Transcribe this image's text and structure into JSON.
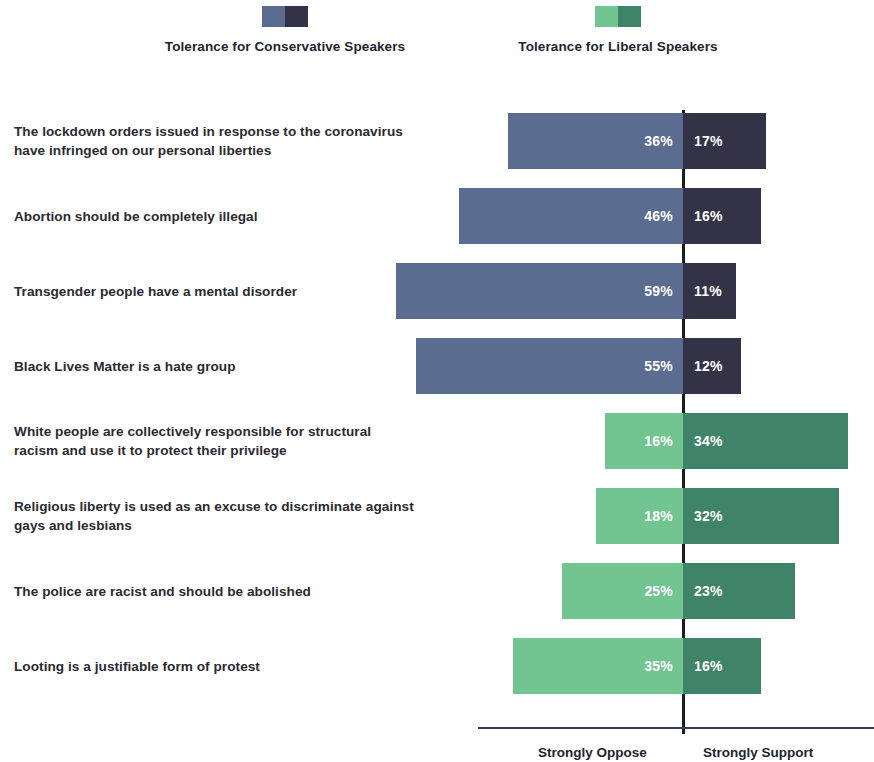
{
  "legend": {
    "items": [
      {
        "label": "Tolerance for Conservative Speakers",
        "color_left": "#5a6d90",
        "color_right": "#343247",
        "name": "conservative"
      },
      {
        "label": "Tolerance for Liberal Speakers",
        "color_left": "#72c491",
        "color_right": "#3f8468",
        "name": "liberal"
      }
    ]
  },
  "axis": {
    "left_label": "Strongly Oppose",
    "right_label": "Strongly Support"
  },
  "chart_data": {
    "type": "bar",
    "title": "",
    "subtype": "diverging-stacked",
    "xlabel": "",
    "ylabel": "",
    "grid": false,
    "legend_position": "top",
    "axis_left_label": "Strongly Oppose",
    "axis_right_label": "Strongly Support",
    "value_unit": "%",
    "center_at": 0,
    "series": [
      {
        "name": "Strongly Oppose",
        "side": "left"
      },
      {
        "name": "Strongly Support",
        "side": "right"
      }
    ],
    "groups": [
      {
        "group": "Tolerance for Conservative Speakers",
        "color_left": "#5a6d90",
        "color_right": "#343247",
        "categories": [
          "The lockdown orders issued in response to the coronavirus have infringed on our personal liberties",
          "Abortion should be completely illegal",
          "Transgender people have a mental disorder",
          "Black Lives Matter is a hate group"
        ],
        "oppose": [
          36,
          46,
          59,
          55
        ],
        "support": [
          17,
          16,
          11,
          12
        ]
      },
      {
        "group": "Tolerance for Liberal Speakers",
        "color_left": "#72c491",
        "color_right": "#3f8468",
        "categories": [
          "White people are collectively responsible for structural racism and use it to protect their privilege",
          "Religious liberty is used as an excuse to discriminate against gays and lesbians",
          "The police are racist and should be abolished",
          "Looting is a justifiable form of protest"
        ],
        "oppose": [
          16,
          18,
          25,
          35
        ],
        "support": [
          34,
          32,
          23,
          16
        ]
      }
    ]
  },
  "rows": [
    {
      "label_lines": [
        "The lockdown orders issued in response to the coronavirus",
        "have infringed on our personal liberties"
      ],
      "oppose": 36,
      "support": 17,
      "oppose_text": "36%",
      "support_text": "17%",
      "color_left": "#5a6d90",
      "color_right": "#343247"
    },
    {
      "label_lines": [
        "Abortion should be completely illegal"
      ],
      "oppose": 46,
      "support": 16,
      "oppose_text": "46%",
      "support_text": "16%",
      "color_left": "#5a6d90",
      "color_right": "#343247"
    },
    {
      "label_lines": [
        "Transgender people have a mental disorder"
      ],
      "oppose": 59,
      "support": 11,
      "oppose_text": "59%",
      "support_text": "11%",
      "color_left": "#5a6d90",
      "color_right": "#343247"
    },
    {
      "label_lines": [
        "Black Lives Matter is a hate group"
      ],
      "oppose": 55,
      "support": 12,
      "oppose_text": "55%",
      "support_text": "12%",
      "color_left": "#5a6d90",
      "color_right": "#343247"
    },
    {
      "label_lines": [
        "White people are collectively responsible for structural",
        "racism and use it to protect their privilege"
      ],
      "oppose": 16,
      "support": 34,
      "oppose_text": "16%",
      "support_text": "34%",
      "color_left": "#72c491",
      "color_right": "#3f8468"
    },
    {
      "label_lines": [
        "Religious liberty is used as an excuse to discriminate against",
        "gays and lesbians"
      ],
      "oppose": 18,
      "support": 32,
      "oppose_text": "18%",
      "support_text": "32%",
      "color_left": "#72c491",
      "color_right": "#3f8468"
    },
    {
      "label_lines": [
        "The police are racist and should be abolished"
      ],
      "oppose": 25,
      "support": 23,
      "oppose_text": "25%",
      "support_text": "23%",
      "color_left": "#72c491",
      "color_right": "#3f8468"
    },
    {
      "label_lines": [
        "Looting is a justifiable form of protest"
      ],
      "oppose": 35,
      "support": 16,
      "oppose_text": "35%",
      "support_text": "16%",
      "color_left": "#72c491",
      "color_right": "#3f8468"
    }
  ],
  "geometry": {
    "center_x": 683,
    "px_per_unit": 4.86,
    "row_top_first": 43,
    "row_pitch": 75,
    "bar_height": 56,
    "axis_left_x": 478,
    "axis_right_x": 874,
    "axis_y": 657
  }
}
